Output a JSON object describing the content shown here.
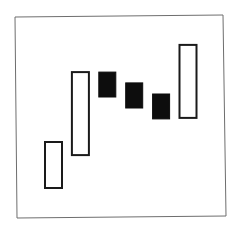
{
  "chart_data": {
    "type": "candlestick",
    "title": "",
    "xlabel": "",
    "ylabel": "",
    "grid": false,
    "legend": null,
    "axes_visible": false,
    "ylim": [
      0,
      100
    ],
    "note": "No axes or tick labels shown; values estimated on a relative 0-100 scale from bar positions.",
    "categories": [
      "1",
      "2",
      "3",
      "4",
      "5",
      "6"
    ],
    "candles": [
      {
        "index": 1,
        "direction": "up",
        "style": "hollow",
        "open": 14.4,
        "close": 37.3
      },
      {
        "index": 2,
        "direction": "up",
        "style": "hollow",
        "open": 30.8,
        "close": 72.1
      },
      {
        "index": 3,
        "direction": "down",
        "style": "filled",
        "open": 72.1,
        "close": 59.7
      },
      {
        "index": 4,
        "direction": "down",
        "style": "filled",
        "open": 66.7,
        "close": 54.2
      },
      {
        "index": 5,
        "direction": "down",
        "style": "filled",
        "open": 61.2,
        "close": 48.8
      },
      {
        "index": 6,
        "direction": "up",
        "style": "hollow",
        "open": 49.3,
        "close": 85.6
      }
    ],
    "colors": {
      "up_fill": "#ffffff",
      "up_stroke": "#1a1a1a",
      "down_fill": "#0d0d0d",
      "frame": "#6e6e6e",
      "background": "#ffffff"
    }
  }
}
